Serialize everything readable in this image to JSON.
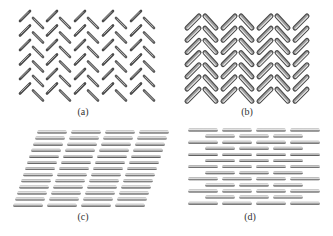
{
  "figure": {
    "panels": [
      {
        "id": "a",
        "label": "(a)",
        "pattern": "alternating-diagonal-rods",
        "description": "Sparse rods alternating between forward and backward diagonal orientation"
      },
      {
        "id": "b",
        "label": "(b)",
        "pattern": "herringbone",
        "description": "Dense herringbone arrangement of thick rods"
      },
      {
        "id": "c",
        "label": "(c)",
        "pattern": "sheared-parallel-rows",
        "description": "Horizontal rods in rows forming a sheared parallelogram lattice"
      },
      {
        "id": "d",
        "label": "(d)",
        "pattern": "brick-layer",
        "description": "Horizontal rods in staggered brick-like layers"
      }
    ],
    "colors": {
      "background": "#ffffff",
      "rod_dark": "#3a3a3a",
      "rod_mid": "#8a8a8a",
      "rod_light": "#d8d8d8",
      "label": "#333333"
    }
  }
}
